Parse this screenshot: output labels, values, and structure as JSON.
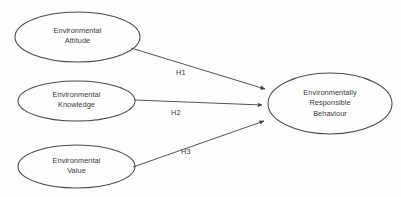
{
  "diagram": {
    "type": "path-model",
    "background_color": "#fdfdfd",
    "stroke_color": "#4a4a4a",
    "text_color": "#3b3b3b",
    "nodes": [
      {
        "id": "environmental-attitude",
        "shape": "ellipse",
        "lines": [
          "Environmental",
          "Attitude"
        ],
        "line1": "Environmental",
        "line2": "Attitude",
        "cx": 77.5,
        "cy": 37,
        "rx": 62.5,
        "ry": 25
      },
      {
        "id": "environmental-knowledge",
        "shape": "ellipse",
        "lines": [
          "Environmental",
          "Knowledge"
        ],
        "line1": "Environmental",
        "line2": "Knowledge",
        "cx": 76.5,
        "cy": 101,
        "rx": 58.5,
        "ry": 20
      },
      {
        "id": "environmental-value",
        "shape": "ellipse",
        "lines": [
          "Environmental",
          "Value"
        ],
        "line1": "Environmental",
        "line2": "Value",
        "cx": 76.5,
        "cy": 166.5,
        "rx": 58.5,
        "ry": 21.5
      },
      {
        "id": "environmentally-responsible-behaviour",
        "shape": "ellipse",
        "lines": [
          "Environmentally",
          "Responsible",
          "Behaviour"
        ],
        "line1": "Environmentally",
        "line2": "Responsible",
        "line3": "Behaviour",
        "cx": 330,
        "cy": 103.5,
        "rx": 62,
        "ry": 30.5
      }
    ],
    "edges": [
      {
        "id": "h1",
        "label": "H1",
        "from": "environmental-attitude",
        "to": "environmentally-responsible-behaviour",
        "x1": 131,
        "y1": 48,
        "x2": 265,
        "y2": 89,
        "label_x": 176,
        "label_y": 68
      },
      {
        "id": "h2",
        "label": "H2",
        "from": "environmental-knowledge",
        "to": "environmentally-responsible-behaviour",
        "x1": 135,
        "y1": 100,
        "x2": 262,
        "y2": 105,
        "label_x": 171,
        "label_y": 108
      },
      {
        "id": "h3",
        "label": "H3",
        "from": "environmental-value",
        "to": "environmentally-responsible-behaviour",
        "x1": 133,
        "y1": 167,
        "x2": 264,
        "y2": 121,
        "label_x": 181,
        "label_y": 147
      }
    ]
  }
}
